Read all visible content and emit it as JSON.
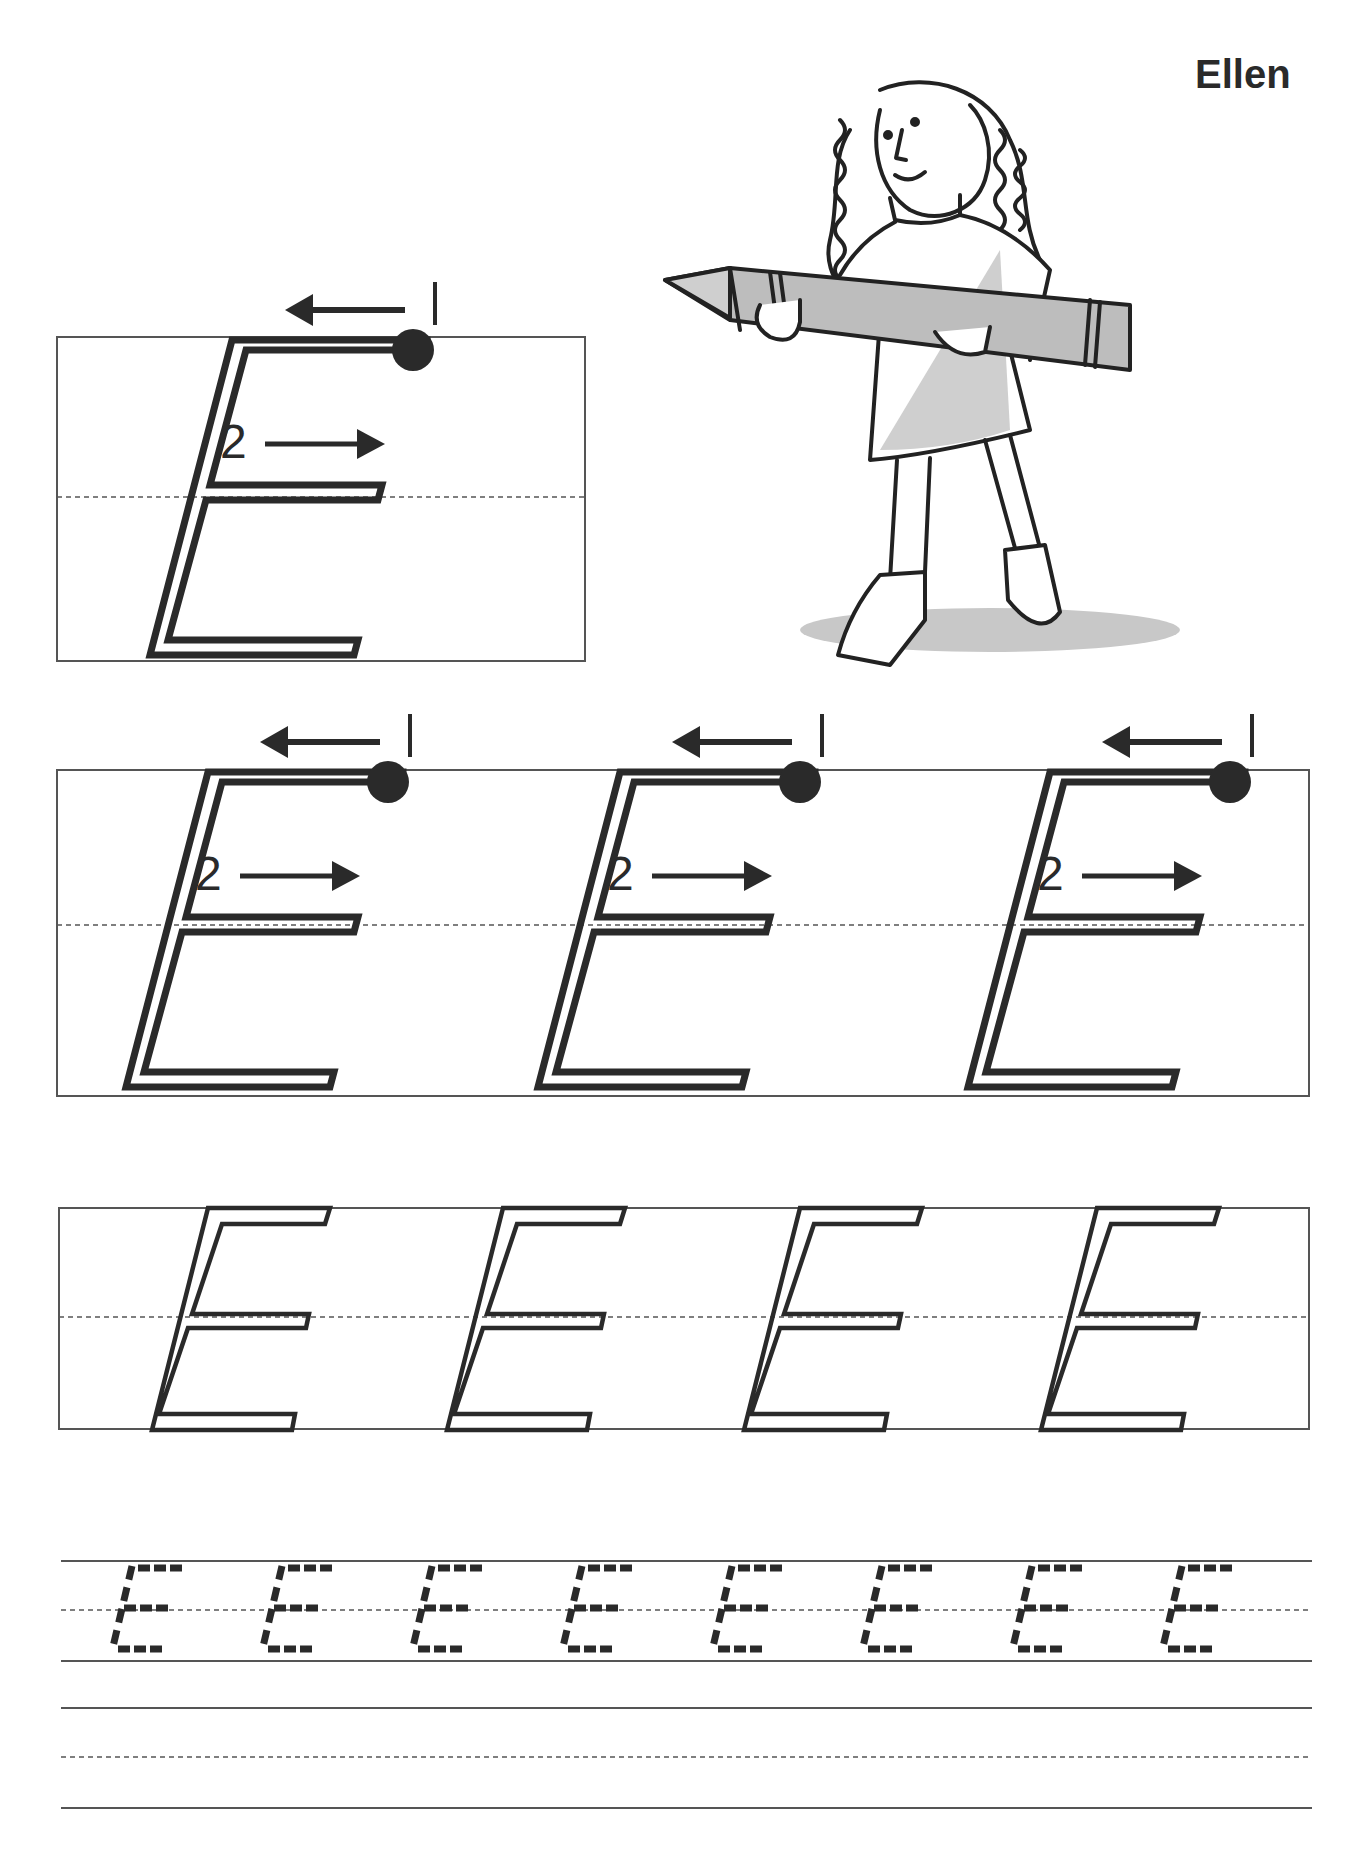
{
  "worksheet": {
    "name_label": "Ellen",
    "letter": "E",
    "stroke_numbers": [
      "1",
      "2"
    ],
    "sections": {
      "demo_box": {
        "letter_count": 1,
        "style": "outlined-with-stroke-guides"
      },
      "guided_row": {
        "letter_count": 3,
        "style": "outlined-with-stroke-guides"
      },
      "trace_outline_row": {
        "letter_count": 4,
        "style": "outlined"
      },
      "dashed_trace_row": {
        "letter_count": 8,
        "style": "dashed"
      },
      "blank_practice_row": {
        "letter_count": 0,
        "style": "empty-lines"
      }
    },
    "illustration": "girl-holding-giant-crayon",
    "colors": {
      "ink": "#2a2a2a",
      "rule_line": "#555555",
      "gray_fill": "#bdbdbd"
    }
  }
}
